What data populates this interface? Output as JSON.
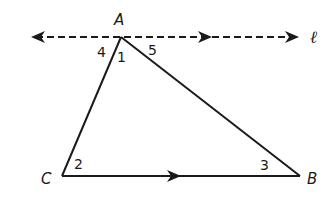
{
  "diagram": {
    "type": "geometry",
    "colors": {
      "stroke": "#1a1a1a",
      "background": "#ffffff"
    },
    "line": {
      "label": "ℓ",
      "style": "dashed",
      "parallel_to": "CB"
    },
    "vertices": {
      "A": {
        "label": "A",
        "x": 121,
        "y": 37
      },
      "B": {
        "label": "B",
        "x": 300,
        "y": 176
      },
      "C": {
        "label": "C",
        "x": 62,
        "y": 176
      }
    },
    "angles": [
      {
        "id": "angle-1",
        "label": "1",
        "at": "A",
        "between": "AC,AB"
      },
      {
        "id": "angle-2",
        "label": "2",
        "at": "C",
        "between": "CA,CB"
      },
      {
        "id": "angle-3",
        "label": "3",
        "at": "B",
        "between": "BA,BC"
      },
      {
        "id": "angle-4",
        "label": "4",
        "at": "A",
        "between": "l-left,AC"
      },
      {
        "id": "angle-5",
        "label": "5",
        "at": "A",
        "between": "AB,l-right"
      }
    ]
  }
}
